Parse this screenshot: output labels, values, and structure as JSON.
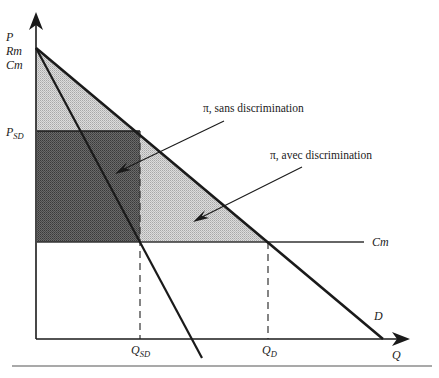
{
  "diagram": {
    "axes": {
      "y_label": "P",
      "y_labels_at_origin_vertex": [
        "P",
        "Rm",
        "Cm"
      ],
      "x_label": "Q"
    },
    "curves": {
      "demand": {
        "label": "D"
      },
      "marginal_revenue": {
        "label": "Rm"
      },
      "marginal_cost": {
        "label": "Cm"
      }
    },
    "price_marks": {
      "p_sd": {
        "label_main": "P",
        "label_sub": "SD"
      }
    },
    "quantity_marks": {
      "q_sd": {
        "label_main": "Q",
        "label_sub": "SD"
      },
      "q_d": {
        "label_main": "Q",
        "label_sub": "D"
      }
    },
    "annotations": {
      "profit_sans": "π, sans discrimination",
      "profit_avec": "π, avec discrimination"
    },
    "colors": {
      "dark_area": "#5a5a5a",
      "light_area": "#cfcfcf",
      "line": "#1a1a1a"
    }
  }
}
